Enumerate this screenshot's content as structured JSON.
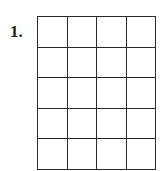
{
  "problem": {
    "number_label": "1."
  },
  "grid": {
    "columns": 4,
    "rows": 5,
    "line_color": "#2a2a2a",
    "cells": [
      [
        "",
        "",
        "",
        ""
      ],
      [
        "",
        "",
        "",
        ""
      ],
      [
        "",
        "",
        "",
        ""
      ],
      [
        "",
        "",
        "",
        ""
      ],
      [
        "",
        "",
        "",
        ""
      ]
    ]
  }
}
